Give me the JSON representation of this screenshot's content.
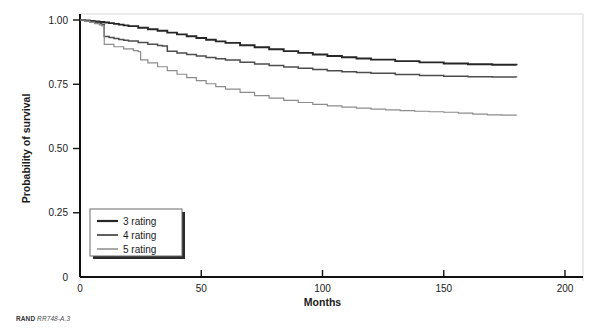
{
  "chart_data": {
    "type": "line",
    "subtype": "kaplan-meier-survival",
    "title": "",
    "xlabel": "Months",
    "ylabel": "Probability of survival",
    "xlim": [
      0,
      200
    ],
    "ylim": [
      0,
      1.0
    ],
    "xticks": [
      0,
      50,
      100,
      150,
      200
    ],
    "xtick_labels": [
      "0",
      "50",
      "100",
      "150",
      "200"
    ],
    "yticks": [
      0,
      0.25,
      0.5,
      0.75,
      1.0
    ],
    "ytick_labels": [
      "0",
      "0.25",
      "0.50",
      "0.75",
      "1.00"
    ],
    "grid": false,
    "legend_position": "lower-left-inside",
    "data_x_max": 180,
    "series": [
      {
        "name": "3 rating",
        "color": "#262626",
        "width": 1.9,
        "x": [
          0,
          2,
          4,
          6,
          8,
          10,
          12,
          14,
          16,
          18,
          20,
          24,
          28,
          32,
          36,
          40,
          44,
          48,
          52,
          56,
          60,
          66,
          72,
          78,
          84,
          90,
          96,
          102,
          108,
          114,
          120,
          130,
          140,
          150,
          160,
          170,
          180
        ],
        "y": [
          1.0,
          0.998,
          0.996,
          0.994,
          0.992,
          0.99,
          0.988,
          0.985,
          0.982,
          0.979,
          0.976,
          0.97,
          0.964,
          0.958,
          0.951,
          0.944,
          0.937,
          0.93,
          0.923,
          0.917,
          0.911,
          0.902,
          0.894,
          0.886,
          0.879,
          0.872,
          0.866,
          0.86,
          0.855,
          0.85,
          0.846,
          0.84,
          0.835,
          0.831,
          0.828,
          0.826,
          0.824
        ]
      },
      {
        "name": "4 rating",
        "color": "#4d4d4d",
        "width": 1.5,
        "x": [
          0,
          2,
          4,
          6,
          8,
          9,
          10,
          12,
          14,
          16,
          18,
          20,
          24,
          28,
          32,
          34,
          36,
          40,
          44,
          48,
          52,
          56,
          60,
          66,
          72,
          78,
          84,
          90,
          96,
          102,
          108,
          114,
          120,
          130,
          140,
          150,
          160,
          170,
          180
        ],
        "y": [
          1.0,
          0.997,
          0.994,
          0.99,
          0.986,
          0.982,
          0.936,
          0.932,
          0.928,
          0.924,
          0.921,
          0.918,
          0.912,
          0.906,
          0.901,
          0.899,
          0.878,
          0.872,
          0.866,
          0.86,
          0.854,
          0.849,
          0.844,
          0.836,
          0.829,
          0.823,
          0.817,
          0.812,
          0.807,
          0.803,
          0.799,
          0.796,
          0.793,
          0.788,
          0.784,
          0.781,
          0.779,
          0.778,
          0.777
        ]
      },
      {
        "name": "5 rating",
        "color": "#8c8c8c",
        "width": 1.2,
        "x": [
          0,
          2,
          4,
          6,
          8,
          9,
          10,
          14,
          18,
          22,
          24,
          25,
          28,
          32,
          36,
          40,
          44,
          48,
          52,
          56,
          60,
          66,
          72,
          78,
          84,
          90,
          96,
          102,
          108,
          114,
          120,
          126,
          132,
          138,
          144,
          150,
          156,
          162,
          168,
          174,
          180
        ],
        "y": [
          1.0,
          0.996,
          0.991,
          0.986,
          0.981,
          0.977,
          0.905,
          0.896,
          0.888,
          0.881,
          0.877,
          0.845,
          0.833,
          0.818,
          0.803,
          0.789,
          0.776,
          0.764,
          0.752,
          0.741,
          0.731,
          0.718,
          0.706,
          0.696,
          0.687,
          0.679,
          0.672,
          0.666,
          0.661,
          0.657,
          0.653,
          0.65,
          0.647,
          0.645,
          0.643,
          0.641,
          0.638,
          0.634,
          0.631,
          0.63,
          0.629
        ]
      }
    ]
  },
  "legend": {
    "items": [
      {
        "label": "3 rating"
      },
      {
        "label": "4 rating"
      },
      {
        "label": "5 rating"
      }
    ]
  },
  "footnote": {
    "brand": "RAND",
    "code": "RR748-A.3"
  }
}
